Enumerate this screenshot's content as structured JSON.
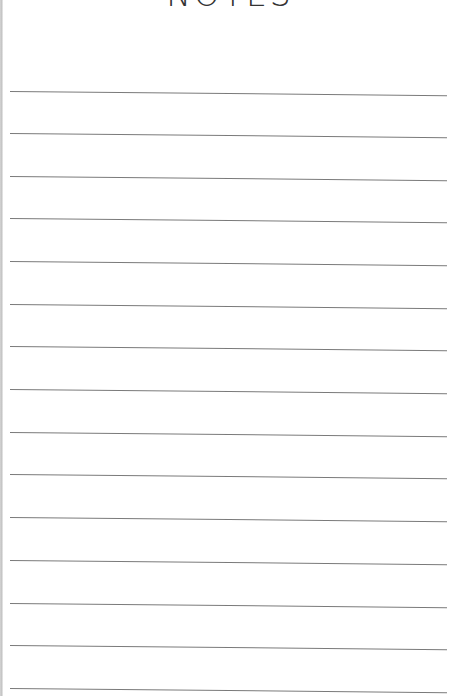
{
  "page": {
    "title": "NOTES",
    "line_color": "#7a7a7a",
    "background": "#ffffff"
  },
  "ruled_lines": {
    "count": 15,
    "left_y": [
      91,
      133,
      176,
      218,
      261,
      304,
      346,
      389,
      432,
      474,
      517,
      560,
      603,
      645,
      688
    ]
  }
}
